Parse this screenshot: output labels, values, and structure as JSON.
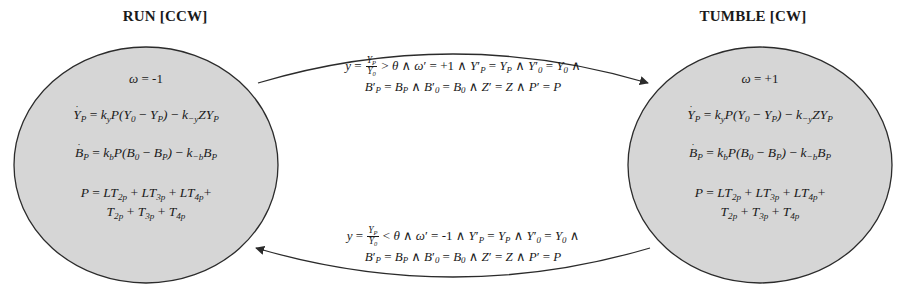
{
  "diagram": {
    "kind": "hybrid-automaton-state-machine",
    "title": "",
    "colors": {
      "node_fill": "#d6d6d6",
      "node_stroke": "#2b2b2b",
      "edge_stroke": "#2b2b2b",
      "text": "#1a1a1a",
      "background": "#ffffff"
    },
    "states": [
      {
        "id": "run",
        "title": "RUN [CCW]",
        "mode_label": "RUN",
        "rotation": "CCW",
        "omega": "-1",
        "equations": [
          "ω = −1",
          "Ẏ_P = k_y P(Y_0 − Y_P) − k_{−y} Z Y_P",
          "Ḃ_P = k_b P(B_0 − B_P) − k_{−b} B_P",
          "P = LT_{2p} + LT_{3p} + LT_{4p} + T_{2p} + T_{3p} + T_{4p}"
        ]
      },
      {
        "id": "tumble",
        "title": "TUMBLE [CW]",
        "mode_label": "TUMBLE",
        "rotation": "CW",
        "omega": "+1",
        "equations": [
          "ω = +1",
          "Ẏ_P = k_y P(Y_0 − Y_P) − k_{−y} Z Y_P",
          "Ḃ_P = k_b P(B_0 − B_P) − k_{−b} B_P",
          "P = LT_{2p} + LT_{3p} + LT_{4p} + T_{2p} + T_{3p} + T_{4p}"
        ]
      }
    ],
    "transitions": [
      {
        "id": "run-to-tumble",
        "from": "run",
        "to": "tumble",
        "direction": "left-to-right",
        "guard_variable": "y",
        "guard_numerator": "Y_P",
        "guard_denominator": "Y_0",
        "guard_relation": ">",
        "guard_threshold": "θ",
        "reset_omega": "+1",
        "line1_plain": "y = Y_P/Y_0 > θ ∧ ω′ = +1 ∧ Y′_P = Y_P ∧ Y′_0 = Y_0 ∧",
        "line2_plain": "B′_P = B_P ∧ B′_0 = B_0 ∧ Z′ = Z ∧ P′ = P"
      },
      {
        "id": "tumble-to-run",
        "from": "tumble",
        "to": "run",
        "direction": "right-to-left",
        "guard_variable": "y",
        "guard_numerator": "Y_P",
        "guard_denominator": "Y_0",
        "guard_relation": "<",
        "guard_threshold": "θ",
        "reset_omega": "-1",
        "line1_plain": "y = Y_P/Y_0 < θ ∧ ω′ = −1 ∧ Y′_P = Y_P ∧ Y′_0 = Y_0 ∧",
        "line2_plain": "B′_P = B_P ∧ B′_0 = B_0 ∧ Z′ = Z ∧ P′ = P"
      }
    ],
    "symbols": {
      "omega": "ω",
      "theta": "θ",
      "and": "∧",
      "minus": "−",
      "prime": "′",
      "equals": "=",
      "plus": "+"
    }
  }
}
